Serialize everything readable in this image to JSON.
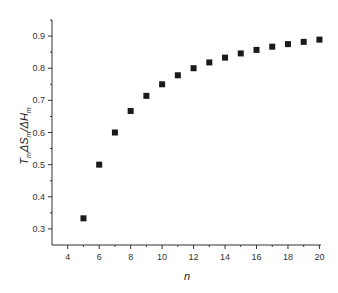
{
  "chart_data": {
    "type": "scatter",
    "title": "",
    "xlabel": "n",
    "ylabel": "TmΔSm/ΔHm",
    "ylabel_parts": {
      "T": "T",
      "T_sub": "m",
      "dS": "ΔS",
      "dS_sub": "m",
      "slash": "/ΔH",
      "dH_sub": "m"
    },
    "xlim": [
      3,
      20.1
    ],
    "ylim": [
      0.25,
      0.95
    ],
    "x_ticks": [
      4,
      6,
      8,
      10,
      12,
      14,
      16,
      18,
      20
    ],
    "x_tick_labels": [
      "4",
      "6",
      "8",
      "10",
      "12",
      "14",
      "16",
      "18",
      "20"
    ],
    "y_ticks": [
      0.3,
      0.4,
      0.5,
      0.6,
      0.7,
      0.8,
      0.9
    ],
    "y_tick_labels": [
      "0.3",
      "0.4",
      "0.5",
      "0.6",
      "0.7",
      "0.8",
      "0.9"
    ],
    "grid": false,
    "legend": null,
    "marker": "square",
    "marker_color": "#1a1a1a",
    "x": [
      5,
      6,
      7,
      8,
      9,
      10,
      11,
      12,
      13,
      14,
      15,
      16,
      17,
      18,
      19,
      20
    ],
    "y": [
      0.333,
      0.5,
      0.6,
      0.667,
      0.714,
      0.75,
      0.778,
      0.8,
      0.818,
      0.833,
      0.846,
      0.857,
      0.867,
      0.875,
      0.882,
      0.889
    ]
  }
}
